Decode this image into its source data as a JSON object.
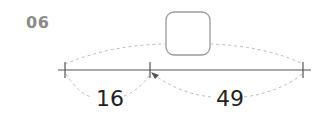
{
  "problem": {
    "number": "06"
  },
  "number_line": {
    "segments": [
      {
        "label": "16"
      },
      {
        "label": "49"
      }
    ],
    "answer_box": {
      "value": ""
    }
  },
  "colors": {
    "line": "#555555",
    "dashed": "#bbbbbb",
    "box_border": "#9a9a9a",
    "number": "#8a8a8a"
  }
}
